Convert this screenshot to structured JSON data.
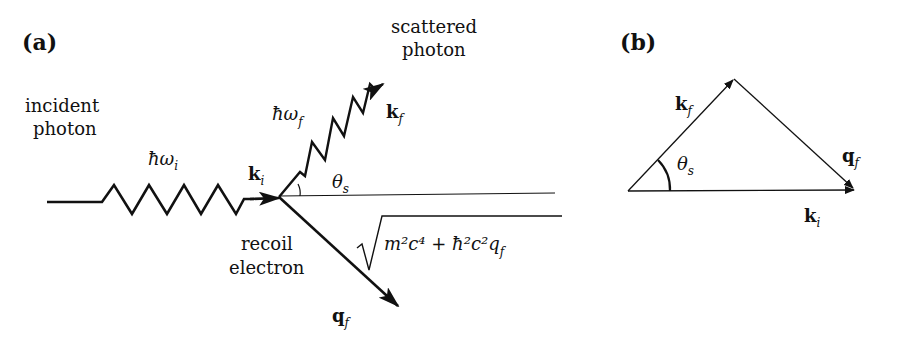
{
  "panel_a": {
    "label": "(a)",
    "incident_label_line1": "incident",
    "incident_label_line2": "photon",
    "incident_energy": "ħω",
    "incident_energy_sub": "i",
    "incident_k": "k",
    "incident_k_sub": "i",
    "scattered_label_line1": "scattered",
    "scattered_label_line2": "photon",
    "scattered_energy": "ħω",
    "scattered_energy_sub": "f",
    "scattered_k": "k",
    "scattered_k_sub": "f",
    "angle": "θ",
    "angle_sub": "s",
    "recoil_label_line1": "recoil",
    "recoil_label_line2": "electron",
    "electron_energy": "m²c⁴ + ħ²c²q",
    "electron_energy_sub": "f",
    "electron_q": "q",
    "electron_q_sub": "f"
  },
  "panel_b": {
    "label": "(b)",
    "kf": "k",
    "kf_sub": "f",
    "qf": "q",
    "qf_sub": "f",
    "ki": "k",
    "ki_sub": "i",
    "angle": "θ",
    "angle_sub": "s"
  }
}
